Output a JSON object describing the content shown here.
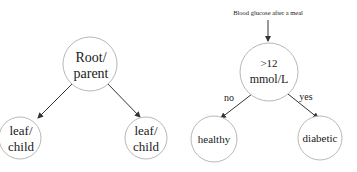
{
  "generic_tree": {
    "root": {
      "line1": "Root/",
      "line2": "parent"
    },
    "left_leaf": {
      "line1": "leaf/",
      "line2": "child"
    },
    "right_leaf": {
      "line1": "leaf/",
      "line2": "child"
    }
  },
  "example_tree": {
    "input_label": "Blood glucose after a meal",
    "root": {
      "line1": ">12",
      "line2": "mmol/L"
    },
    "left_edge_label": "no",
    "right_edge_label": "yes",
    "left_leaf": "healthy",
    "right_leaf": "diabetic"
  },
  "colors": {
    "node_stroke": "#b8b8b8",
    "edge": "#333333",
    "text": "#1a1a1a"
  }
}
